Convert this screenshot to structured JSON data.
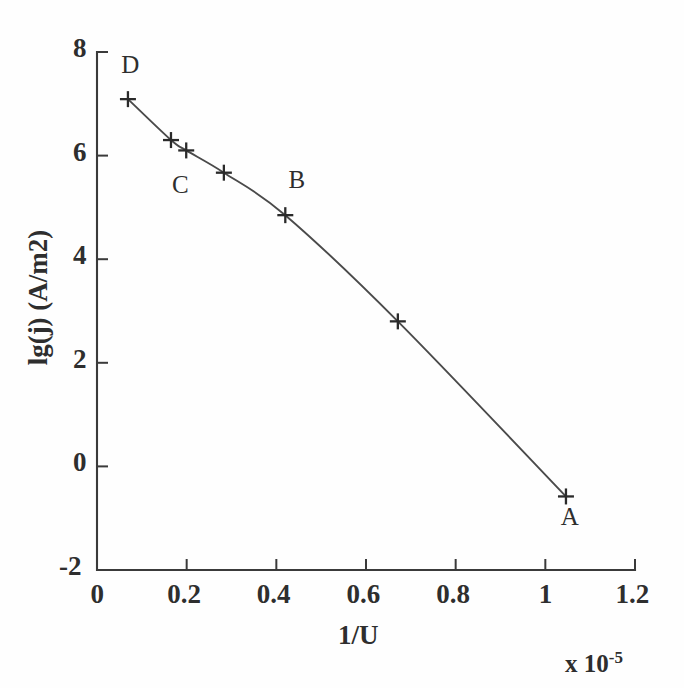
{
  "figure": {
    "background_color": "#fefefe",
    "ink_color": "#3a3a3a"
  },
  "chart_data": {
    "type": "line",
    "title": "",
    "subtitle": "",
    "xlabel": "1/U",
    "ylabel": "lg(j) (A/m2)",
    "x_exponent_label": "x 10",
    "x_exponent_value": "-5",
    "xlim": [
      0,
      1.2
    ],
    "ylim": [
      -2,
      8
    ],
    "xticks": [
      "0",
      "0.2",
      "0.4",
      "0.6",
      "0.8",
      "1",
      "1.2"
    ],
    "xtick_values": [
      0,
      0.2,
      0.4,
      0.6,
      0.8,
      1.0,
      1.2
    ],
    "yticks": [
      "8",
      "6",
      "4",
      "2",
      "0",
      "-2"
    ],
    "ytick_values": [
      8,
      6,
      4,
      2,
      0,
      -2
    ],
    "grid": false,
    "legend": "none",
    "marker_style": "plus",
    "x": [
      0.069,
      0.165,
      0.199,
      0.283,
      0.42,
      0.671,
      1.046
    ],
    "y": [
      7.09,
      6.3,
      6.1,
      5.67,
      4.85,
      2.8,
      -0.58
    ],
    "series": [
      {
        "name": "lg(j) vs 1/U",
        "points": [
          {
            "x": 0.069,
            "y": 7.09,
            "label": "D"
          },
          {
            "x": 0.165,
            "y": 6.3,
            "label": ""
          },
          {
            "x": 0.199,
            "y": 6.1,
            "label": ""
          },
          {
            "x": 0.283,
            "y": 5.67,
            "label": ""
          },
          {
            "x": 0.42,
            "y": 4.85,
            "label": "B"
          },
          {
            "x": 0.671,
            "y": 2.8,
            "label": ""
          },
          {
            "x": 1.046,
            "y": -0.58,
            "label": "A"
          }
        ]
      }
    ],
    "annotations": [
      {
        "text": "D",
        "x": 0.072,
        "y": 7.68
      },
      {
        "text": "C",
        "x": 0.185,
        "y": 5.35
      },
      {
        "text": "B",
        "x": 0.445,
        "y": 5.45
      },
      {
        "text": "A",
        "x": 1.052,
        "y": -1.05
      }
    ]
  }
}
